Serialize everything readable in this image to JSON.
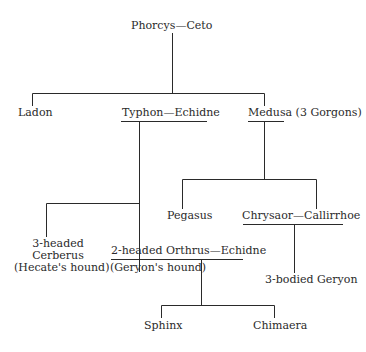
{
  "nodes": {
    "root": "Phorcys—Ceto",
    "ladon": "Ladon",
    "typhon_echidne": "Typhon—Echidne",
    "medusa": "Medusa (3 Gorgons)",
    "cerberus_1": "3-headed",
    "cerberus_2": "Cerberus",
    "cerberus_3": "(Hecate's hound)",
    "orthrus": "2-headed Orthrus—Echidne",
    "orthrus_note": "(Geryon's hound)",
    "pegasus": "Pegasus",
    "chrysaor_callirrhoe": "Chrysaor—Callirrhoe",
    "geryon": "3-bodied Geryon",
    "sphinx": "Sphinx",
    "chimaera": "Chimaera"
  },
  "colors": {
    "line": "#2a2a2a",
    "text": "#2a2a2a",
    "background": "#ffffff"
  }
}
